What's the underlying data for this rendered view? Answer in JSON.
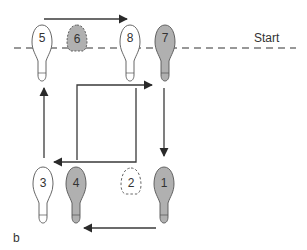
{
  "diagram": {
    "start_label": "Start",
    "panel_label": "b",
    "colors": {
      "line": "#3a3a3a",
      "shoe_fill_shaded": "#b0b0b0",
      "shoe_fill_white": "#ffffff",
      "shoe_outline": "#555555",
      "dashed_line": "#777777"
    },
    "steps": [
      {
        "number": "1",
        "style": "shaded",
        "position": "bottom-right"
      },
      {
        "number": "2",
        "style": "dashed-toe",
        "position": "bottom-center-right"
      },
      {
        "number": "3",
        "style": "white",
        "position": "bottom-left"
      },
      {
        "number": "4",
        "style": "shaded",
        "position": "bottom-center-left"
      },
      {
        "number": "5",
        "style": "white",
        "position": "top-left"
      },
      {
        "number": "6",
        "style": "shaded-dashed-toe",
        "position": "top-center-left"
      },
      {
        "number": "7",
        "style": "shaded",
        "position": "top-right"
      },
      {
        "number": "8",
        "style": "white",
        "position": "top-center-right"
      }
    ],
    "arrows": [
      {
        "name": "top-right-arrow",
        "direction": "right"
      },
      {
        "name": "down-arrow-right",
        "direction": "down"
      },
      {
        "name": "bottom-left-arrow",
        "direction": "left"
      },
      {
        "name": "up-arrow-left",
        "direction": "up"
      },
      {
        "name": "box-path-arrow",
        "direction": "right-then-down-then-left"
      }
    ]
  }
}
